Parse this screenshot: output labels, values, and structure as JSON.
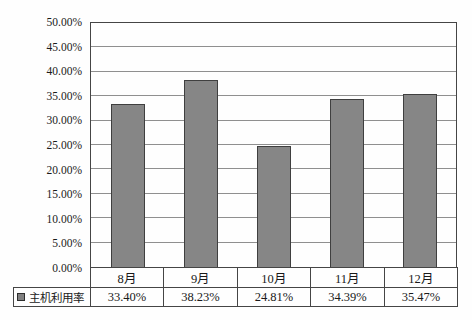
{
  "chart_data": {
    "type": "bar",
    "title": "",
    "xlabel": "",
    "ylabel": "",
    "categories": [
      "8月",
      "9月",
      "10月",
      "11月",
      "12月"
    ],
    "series": [
      {
        "name": "主机利用率",
        "values": [
          33.4,
          38.23,
          24.81,
          34.39,
          35.47
        ],
        "value_labels": [
          "33.40%",
          "38.23%",
          "24.81%",
          "34.39%",
          "35.47%"
        ]
      }
    ],
    "ylim": [
      0,
      50
    ],
    "y_tick_step": 5,
    "y_ticks": [
      "50.00%",
      "45.00%",
      "40.00%",
      "35.00%",
      "30.00%",
      "25.00%",
      "20.00%",
      "15.00%",
      "10.00%",
      "5.00%",
      "0.00%"
    ],
    "y_tick_values": [
      50,
      45,
      40,
      35,
      30,
      25,
      20,
      15,
      10,
      5,
      0
    ],
    "grid": true,
    "legend_position": "bottom-table-left",
    "bar_fill_color": "#868686",
    "bar_border_color": "#3f3f3f",
    "gridline_color": "#8f8f8f",
    "axis_border_color": "#454545"
  }
}
